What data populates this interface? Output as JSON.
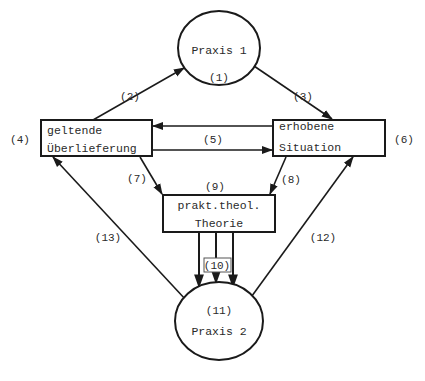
{
  "diagram": {
    "nodes": {
      "praxis1": {
        "label": "Praxis 1",
        "number": "(1)"
      },
      "ueberlieferung": {
        "line1": "geltende",
        "line2": "Überlieferung",
        "number": "(4)"
      },
      "situation": {
        "line1": "erhobene",
        "line2": "Situation",
        "number": "(6)"
      },
      "theorie": {
        "line1": "prakt.theol.",
        "line2": "Theorie",
        "number": "(9)"
      },
      "praxis2": {
        "label": "Praxis 2",
        "number": "(11)"
      }
    },
    "edges": [
      {
        "id": "e2",
        "label": "(2)",
        "from": "ueberlieferung",
        "to": "praxis1"
      },
      {
        "id": "e3",
        "label": "(3)",
        "from": "praxis1",
        "to": "situation"
      },
      {
        "id": "e5a",
        "label": "(5)",
        "from": "situation",
        "to": "ueberlieferung"
      },
      {
        "id": "e5b",
        "label": "",
        "from": "ueberlieferung",
        "to": "situation"
      },
      {
        "id": "e7",
        "label": "(7)",
        "from": "ueberlieferung",
        "to": "theorie"
      },
      {
        "id": "e8",
        "label": "(8)",
        "from": "situation",
        "to": "theorie"
      },
      {
        "id": "e10",
        "label": "(10)",
        "from": "theorie",
        "to": "praxis2",
        "count": 3
      },
      {
        "id": "e12",
        "label": "(12)",
        "from": "praxis2",
        "to": "situation"
      },
      {
        "id": "e13",
        "label": "(13)",
        "from": "praxis2",
        "to": "ueberlieferung"
      }
    ],
    "colors": {
      "stroke": "#1a1a1a",
      "text": "#2a2a2a",
      "background": "#ffffff"
    }
  }
}
